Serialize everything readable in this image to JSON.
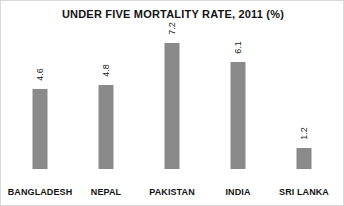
{
  "chart_data": {
    "type": "bar",
    "title": "UNDER FIVE MORTALITY RATE, 2011 (%)",
    "xlabel": "",
    "ylabel": "",
    "ylim": [
      0,
      8
    ],
    "grid": false,
    "legend": null,
    "value_label_rotation": "vertical",
    "bar_color": "#8a8a8a",
    "categories": [
      "BANGLADESH",
      "NEPAL",
      "PAKISTAN",
      "INDIA",
      "SRI LANKA"
    ],
    "values": [
      4.6,
      4.8,
      7.2,
      6.1,
      1.2
    ],
    "value_labels": [
      "4.6",
      "4.8",
      "7.2",
      "6.1",
      "1.2"
    ]
  }
}
